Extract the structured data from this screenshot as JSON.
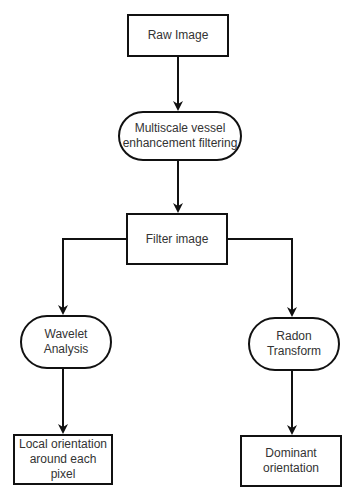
{
  "diagram": {
    "type": "flowchart",
    "nodes": [
      {
        "id": "raw",
        "label": "Raw Image",
        "shape": "rectangle"
      },
      {
        "id": "mvef",
        "label": "Multiscale vessel\nenhancement filtering",
        "shape": "rounded"
      },
      {
        "id": "filter",
        "label": "Filter image",
        "shape": "rectangle"
      },
      {
        "id": "wavelet",
        "label": "Wavelet\nAnalysis",
        "shape": "rounded"
      },
      {
        "id": "radon",
        "label": "Radon\nTransform",
        "shape": "rounded"
      },
      {
        "id": "local",
        "label": "Local orientation\naround each pixel",
        "shape": "rectangle"
      },
      {
        "id": "dominant",
        "label": "Dominant\norientation",
        "shape": "rectangle"
      }
    ],
    "edges": [
      {
        "from": "raw",
        "to": "mvef"
      },
      {
        "from": "mvef",
        "to": "filter"
      },
      {
        "from": "filter",
        "to": "wavelet"
      },
      {
        "from": "filter",
        "to": "radon"
      },
      {
        "from": "wavelet",
        "to": "local"
      },
      {
        "from": "radon",
        "to": "dominant"
      }
    ]
  },
  "labels": {
    "raw": "Raw Image",
    "mvef": "Multiscale vessel\nenhancement filtering",
    "filter": "Filter image",
    "wavelet": "Wavelet\nAnalysis",
    "radon": "Radon\nTransform",
    "local": "Local orientation\naround each pixel",
    "dominant": "Dominant\norientation"
  },
  "colors": {
    "stroke": "#111111",
    "text": "#333333",
    "background": "#ffffff"
  }
}
